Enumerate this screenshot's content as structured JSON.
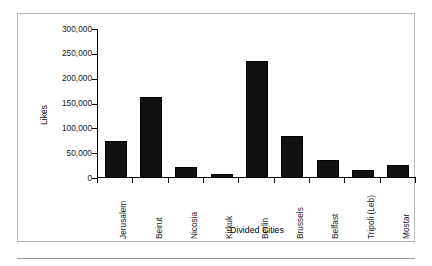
{
  "chart_data": {
    "type": "bar",
    "title": "",
    "xlabel": "Divided Cities",
    "ylabel": "Likes",
    "categories": [
      "Jerusalem",
      "Beirut",
      "Nicosia",
      "Kirkuk",
      "Berlin",
      "Brussels",
      "Belfast",
      "Tripoli (Leb)",
      "Mostar"
    ],
    "values": [
      74000,
      163000,
      23000,
      8000,
      236000,
      85000,
      36000,
      17000,
      27000
    ],
    "ylim": [
      0,
      300000
    ],
    "ytick_values": [
      0,
      50000,
      100000,
      150000,
      200000,
      250000,
      300000
    ],
    "ytick_labels": [
      "0",
      "50,000",
      "100,000",
      "150,000",
      "200,000",
      "250,000",
      "300,000"
    ],
    "grid": false,
    "legend": false,
    "bar_color": "#111111",
    "frame_color": "#b9b9b9",
    "axis_color": "#000000"
  }
}
